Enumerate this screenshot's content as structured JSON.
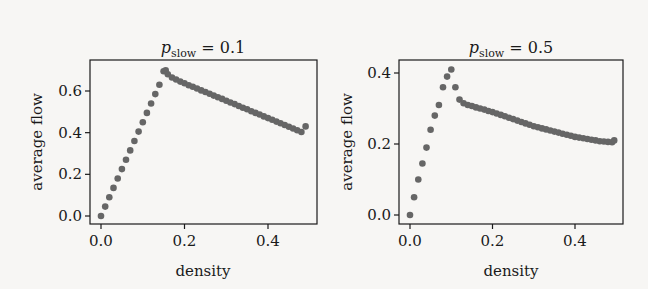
{
  "colors": {
    "marker": "#666666",
    "frame": "#1a1a1a",
    "background": "#f7f6f4"
  },
  "chart_data": [
    {
      "type": "scatter",
      "title": "p_slow = 0.1",
      "title_main": "p",
      "title_sub": "slow",
      "title_rest": " = 0.1",
      "xlabel": "density",
      "ylabel": "average flow",
      "xlim": [
        -0.013,
        0.52
      ],
      "ylim": [
        -0.025,
        0.75
      ],
      "xticks": [
        0.0,
        0.2,
        0.4
      ],
      "xtick_labels": [
        "0.0",
        "0.2",
        "0.4"
      ],
      "yticks": [
        0.0,
        0.2,
        0.4,
        0.6
      ],
      "ytick_labels": [
        "0.0",
        "0.2",
        "0.4",
        "0.6"
      ],
      "grid": false,
      "x": [
        0.0,
        0.01,
        0.02,
        0.03,
        0.04,
        0.05,
        0.06,
        0.07,
        0.08,
        0.09,
        0.1,
        0.11,
        0.12,
        0.13,
        0.14,
        0.15,
        0.155,
        0.16,
        0.17,
        0.18,
        0.19,
        0.2,
        0.21,
        0.22,
        0.23,
        0.24,
        0.25,
        0.26,
        0.27,
        0.28,
        0.29,
        0.3,
        0.31,
        0.32,
        0.33,
        0.34,
        0.35,
        0.36,
        0.37,
        0.38,
        0.39,
        0.4,
        0.41,
        0.42,
        0.43,
        0.44,
        0.45,
        0.46,
        0.47,
        0.48,
        0.49
      ],
      "y": [
        0.0,
        0.045,
        0.09,
        0.135,
        0.18,
        0.225,
        0.27,
        0.315,
        0.36,
        0.405,
        0.45,
        0.495,
        0.54,
        0.585,
        0.63,
        0.695,
        0.7,
        0.68,
        0.665,
        0.655,
        0.645,
        0.637,
        0.628,
        0.62,
        0.612,
        0.603,
        0.595,
        0.587,
        0.578,
        0.57,
        0.562,
        0.553,
        0.545,
        0.537,
        0.528,
        0.52,
        0.512,
        0.503,
        0.495,
        0.487,
        0.478,
        0.47,
        0.462,
        0.453,
        0.445,
        0.437,
        0.428,
        0.42,
        0.412,
        0.403,
        0.43
      ]
    },
    {
      "type": "scatter",
      "title": "p_slow = 0.5",
      "title_main": "p",
      "title_sub": "slow",
      "title_rest": " = 0.5",
      "xlabel": "density",
      "ylabel": "average flow",
      "xlim": [
        -0.013,
        0.52
      ],
      "ylim": [
        -0.025,
        0.44
      ],
      "xticks": [
        0.0,
        0.2,
        0.4
      ],
      "xtick_labels": [
        "0.0",
        "0.2",
        "0.4"
      ],
      "yticks": [
        0.0,
        0.2,
        0.4
      ],
      "ytick_labels": [
        "0.0",
        "0.2",
        "0.4"
      ],
      "grid": false,
      "x": [
        0.0,
        0.01,
        0.02,
        0.03,
        0.04,
        0.05,
        0.06,
        0.07,
        0.08,
        0.09,
        0.1,
        0.11,
        0.12,
        0.13,
        0.14,
        0.15,
        0.16,
        0.17,
        0.18,
        0.19,
        0.2,
        0.21,
        0.22,
        0.23,
        0.24,
        0.25,
        0.26,
        0.27,
        0.28,
        0.29,
        0.3,
        0.31,
        0.32,
        0.33,
        0.34,
        0.35,
        0.36,
        0.37,
        0.38,
        0.39,
        0.4,
        0.41,
        0.42,
        0.43,
        0.44,
        0.45,
        0.46,
        0.47,
        0.48,
        0.49,
        0.495
      ],
      "y": [
        0.0,
        0.05,
        0.1,
        0.145,
        0.19,
        0.24,
        0.28,
        0.31,
        0.36,
        0.39,
        0.41,
        0.36,
        0.325,
        0.315,
        0.31,
        0.307,
        0.303,
        0.3,
        0.297,
        0.293,
        0.29,
        0.286,
        0.282,
        0.278,
        0.274,
        0.27,
        0.266,
        0.262,
        0.258,
        0.254,
        0.25,
        0.247,
        0.244,
        0.241,
        0.238,
        0.235,
        0.232,
        0.229,
        0.226,
        0.223,
        0.22,
        0.218,
        0.216,
        0.214,
        0.212,
        0.21,
        0.208,
        0.207,
        0.206,
        0.205,
        0.21
      ]
    }
  ]
}
